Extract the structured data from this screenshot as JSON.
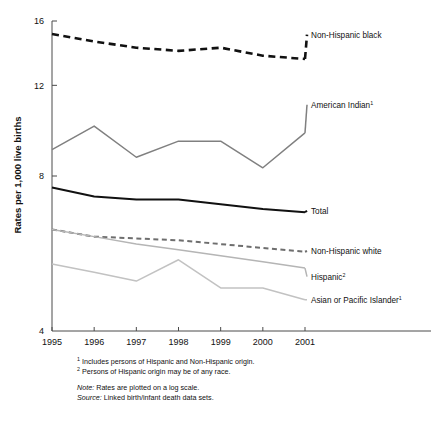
{
  "chart_data": {
    "type": "line",
    "title": "",
    "xlabel": "",
    "ylabel": "Rates per 1,000 live births",
    "x": [
      1995,
      1996,
      1997,
      1998,
      1999,
      2000,
      2001
    ],
    "xticklabels": [
      "1995",
      "1996",
      "1997",
      "1998",
      "1999",
      "2000",
      "2001"
    ],
    "yticks": [
      4,
      8,
      12,
      16
    ],
    "yticklabels": [
      "4",
      "8",
      "12",
      "16"
    ],
    "ylim": [
      4,
      16
    ],
    "yscale": "log",
    "grid": false,
    "legend_position": "right-inline",
    "series": [
      {
        "name": "Non-Hispanic black",
        "label": "Non-Hispanic black",
        "values": [
          15.1,
          14.6,
          14.2,
          14.0,
          14.2,
          13.7,
          13.5
        ],
        "color": "#111111",
        "style": "dashed",
        "width": 2.6,
        "label_y": 15.05
      },
      {
        "name": "American Indian",
        "label": "American Indian",
        "superscript": "1",
        "values": [
          9.0,
          10.0,
          8.7,
          9.35,
          9.35,
          8.3,
          9.7
        ],
        "color": "#808080",
        "style": "solid",
        "width": 1.5,
        "label_y": 11.0
      },
      {
        "name": "Total",
        "label": "Total",
        "values": [
          7.6,
          7.3,
          7.2,
          7.2,
          7.05,
          6.9,
          6.8
        ],
        "color": "#111111",
        "style": "solid",
        "width": 2.0,
        "label_y": 6.85
      },
      {
        "name": "Non-Hispanic white",
        "label": "Non-Hispanic white",
        "values": [
          6.3,
          6.1,
          6.05,
          6.0,
          5.9,
          5.8,
          5.7
        ],
        "color": "#6e6e6e",
        "style": "dashed",
        "width": 2.0,
        "label_y": 5.72
      },
      {
        "name": "Hispanic",
        "label": "Hispanic",
        "superscript": "2",
        "values": [
          6.3,
          6.1,
          5.9,
          5.75,
          5.6,
          5.45,
          5.3
        ],
        "color": "#b5b5b5",
        "style": "solid",
        "width": 1.5,
        "label_y": 5.1
      },
      {
        "name": "Asian or Pacific Islander",
        "label": "Asian or Pacific Islander",
        "superscript": "1",
        "values": [
          5.4,
          5.2,
          5.0,
          5.5,
          4.85,
          4.85,
          4.6
        ],
        "color": "#c2c2c2",
        "style": "solid",
        "width": 1.5,
        "label_y": 4.6
      }
    ],
    "footnotes": [
      {
        "marker": "1",
        "text": "Includes persons of Hispanic and Non-Hispanic origin."
      },
      {
        "marker": "2",
        "text": "Persons of Hispanic origin may be of any race."
      }
    ],
    "notes": [
      {
        "prefix": "Note:",
        "text": "Rates are plotted on a log scale."
      },
      {
        "prefix": "Source:",
        "text": "Linked birth/infant death data sets."
      }
    ]
  }
}
